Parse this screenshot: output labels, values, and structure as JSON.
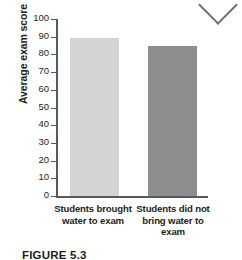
{
  "figure": {
    "caption": "FIGURE 5.3",
    "ornament_icon": "chevron-down-icon"
  },
  "chart_data": {
    "type": "bar",
    "title": "",
    "xlabel": "",
    "ylabel": "Average exam score",
    "categories": [
      "Students brought water to exam",
      "Students did not bring water to exam"
    ],
    "values": [
      89,
      85
    ],
    "ylim": [
      0,
      100
    ],
    "ytick_labels": [
      "100",
      "90",
      "80",
      "70",
      "60",
      "50",
      "40",
      "30",
      "20",
      "10",
      "0"
    ],
    "ytick_values": [
      100,
      90,
      80,
      70,
      60,
      50,
      40,
      30,
      20,
      10,
      0
    ],
    "grid": false,
    "legend": "none",
    "bar_colors": [
      "#d4d4d4",
      "#8d8d8d"
    ],
    "axis_color": "#58595b"
  }
}
